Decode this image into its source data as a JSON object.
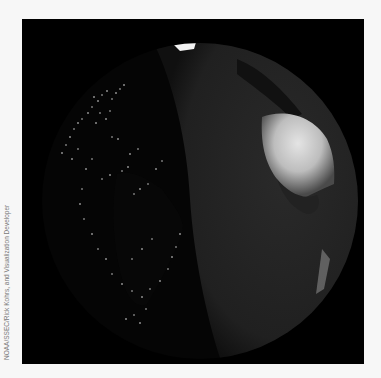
{
  "image": {
    "subject": "Earth globe at night/day terminator with city lights over the Americas and sunlit Africa",
    "background_color": "#000000",
    "page_color": "#f7f7f7"
  },
  "credit": {
    "text": "NOAA/SSEC/Rick Kohrs, and Visualization Developer"
  }
}
